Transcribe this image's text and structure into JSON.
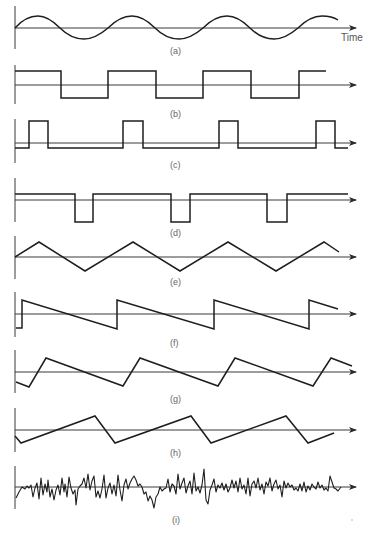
{
  "figure": {
    "time_label": "Time",
    "panels": [
      {
        "id": "a",
        "label": "(a)",
        "type": "sine"
      },
      {
        "id": "b",
        "label": "(b)",
        "type": "square"
      },
      {
        "id": "c",
        "label": "(c)",
        "type": "pulse-train-positive"
      },
      {
        "id": "d",
        "label": "(d)",
        "type": "pulse-train-negative"
      },
      {
        "id": "e",
        "label": "(e)",
        "type": "triangle"
      },
      {
        "id": "f",
        "label": "(f)",
        "type": "sawtooth-falling"
      },
      {
        "id": "g",
        "label": "(g)",
        "type": "asymmetric-sawtooth-falling"
      },
      {
        "id": "h",
        "label": "(h)",
        "type": "asymmetric-sawtooth-rising"
      },
      {
        "id": "i",
        "label": "(i)",
        "type": "random-noise"
      }
    ]
  },
  "colors": {
    "line": "#1e1e1e",
    "axis": "#3a3a3a",
    "label": "#666666",
    "background": "#ffffff"
  }
}
